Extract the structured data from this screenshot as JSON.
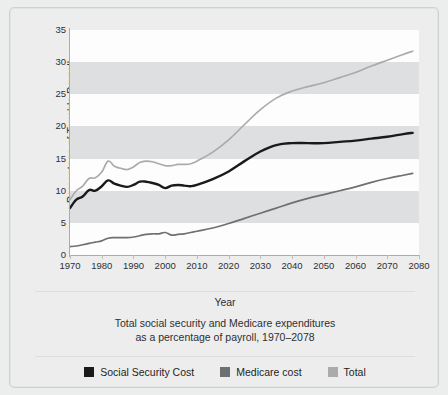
{
  "chart_data": {
    "type": "line",
    "title": "Total social security and Medicare expenditures as a percentage of payroll, 1970–2078",
    "caption_line1": "Total social security and Medicare expenditures",
    "caption_line2": "as a percentage of payroll, 1970–2078",
    "xlabel": "Year",
    "ylabel": "Percentage of Taxable Payroll",
    "xlim": [
      1970,
      2080
    ],
    "ylim": [
      0,
      35
    ],
    "ytick_step": 5,
    "xtick_step": 10,
    "grid": "horizontal-bands",
    "legend_position": "bottom-center",
    "yticks": [
      "35",
      "30",
      "25",
      "20",
      "15",
      "10",
      "5",
      "0"
    ],
    "xticks": [
      "1970",
      "1980",
      "1990",
      "2000",
      "2010",
      "2020",
      "2030",
      "2040",
      "2050",
      "2060",
      "2070",
      "2080"
    ],
    "colors": {
      "social_security": "#1a1a1a",
      "medicare": "#6e7073",
      "total": "#a9abad",
      "band_white": "#fdfdfd",
      "band_gray": "#dedfe0",
      "page_background": "#eceded",
      "card_background": "#ededee",
      "axis": "#a9abad",
      "text": "#2d2f31"
    },
    "series": [
      {
        "name": "Social Security Cost",
        "color": "#1a1a1a",
        "x": [
          1970,
          1972,
          1974,
          1976,
          1978,
          1980,
          1982,
          1984,
          1986,
          1988,
          1990,
          1992,
          1994,
          1996,
          1998,
          2000,
          2002,
          2004,
          2006,
          2008,
          2010,
          2015,
          2020,
          2025,
          2030,
          2035,
          2040,
          2045,
          2050,
          2055,
          2060,
          2065,
          2070,
          2075,
          2078
        ],
        "values": [
          7.3,
          8.6,
          9.1,
          10.1,
          10.0,
          10.7,
          11.6,
          11.1,
          10.8,
          10.6,
          10.9,
          11.4,
          11.4,
          11.2,
          10.9,
          10.4,
          10.8,
          10.9,
          10.8,
          10.7,
          10.9,
          11.8,
          13.0,
          14.6,
          16.1,
          17.1,
          17.4,
          17.4,
          17.4,
          17.6,
          17.8,
          18.1,
          18.4,
          18.8,
          19.0
        ]
      },
      {
        "name": "Medicare cost",
        "color": "#6e7073",
        "x": [
          1970,
          1972,
          1974,
          1976,
          1978,
          1980,
          1982,
          1984,
          1986,
          1988,
          1990,
          1992,
          1994,
          1996,
          1998,
          2000,
          2002,
          2004,
          2006,
          2008,
          2010,
          2015,
          2020,
          2025,
          2030,
          2035,
          2040,
          2045,
          2050,
          2055,
          2060,
          2065,
          2070,
          2075,
          2078
        ],
        "values": [
          1.3,
          1.4,
          1.6,
          1.8,
          2.0,
          2.2,
          2.6,
          2.7,
          2.7,
          2.7,
          2.8,
          3.0,
          3.2,
          3.3,
          3.3,
          3.5,
          3.1,
          3.2,
          3.3,
          3.5,
          3.7,
          4.2,
          4.9,
          5.7,
          6.5,
          7.3,
          8.1,
          8.8,
          9.4,
          10.0,
          10.6,
          11.3,
          11.9,
          12.4,
          12.7
        ]
      },
      {
        "name": "Total",
        "color": "#a9abad",
        "x": [
          1970,
          1972,
          1974,
          1976,
          1978,
          1980,
          1982,
          1984,
          1986,
          1988,
          1990,
          1992,
          1994,
          1996,
          1998,
          2000,
          2002,
          2004,
          2006,
          2008,
          2010,
          2015,
          2020,
          2025,
          2030,
          2035,
          2040,
          2045,
          2050,
          2055,
          2060,
          2065,
          2070,
          2075,
          2078
        ],
        "values": [
          8.6,
          10.0,
          10.7,
          11.9,
          12.0,
          12.9,
          14.6,
          13.8,
          13.5,
          13.3,
          13.7,
          14.4,
          14.6,
          14.5,
          14.2,
          13.9,
          13.9,
          14.1,
          14.1,
          14.2,
          14.6,
          16.0,
          17.9,
          20.3,
          22.6,
          24.4,
          25.5,
          26.2,
          26.8,
          27.6,
          28.4,
          29.4,
          30.3,
          31.2,
          31.7
        ]
      }
    ]
  },
  "legend": {
    "items": [
      {
        "label": "Social Security Cost",
        "color": "#1a1a1a"
      },
      {
        "label": "Medicare cost",
        "color": "#6e7073"
      },
      {
        "label": "Total",
        "color": "#a9abad"
      }
    ]
  }
}
